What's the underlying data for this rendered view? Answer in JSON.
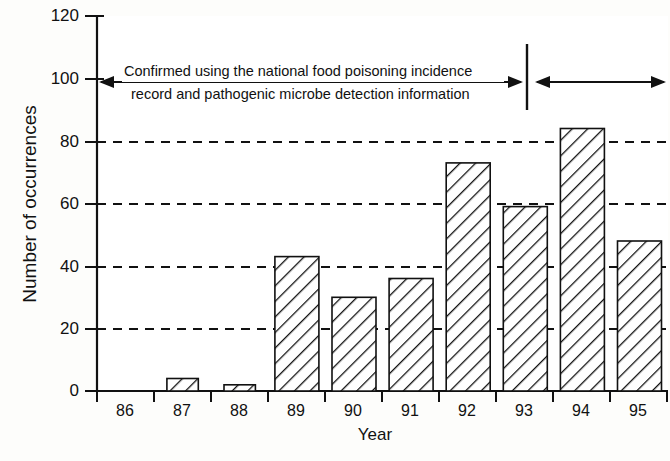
{
  "chart_data": {
    "type": "bar",
    "title": "",
    "xlabel": "Year",
    "ylabel": "Number of occurrences",
    "categories": [
      "86",
      "87",
      "88",
      "89",
      "90",
      "91",
      "92",
      "93",
      "94",
      "95"
    ],
    "values": [
      2,
      4,
      2,
      43,
      30,
      36,
      73,
      59,
      84,
      48
    ],
    "ylim": [
      0,
      120
    ],
    "yticks": [
      0,
      20,
      40,
      60,
      80,
      100,
      120
    ],
    "ytick_labels": [
      "0",
      "20",
      "40",
      "60",
      "80",
      "100",
      "120"
    ],
    "gridlines_at": [
      20,
      40,
      60,
      80
    ],
    "grid": "horizontal-dashed",
    "legend": "none",
    "bar_style": "diagonal-hatch-outline",
    "annotations": [
      {
        "name": "method-note",
        "line1": "Confirmed using the national food poisoning incidence",
        "line2": "record and pathogenic microbe detection information",
        "span_arrow": "double-headed-left-span",
        "span_start_category": "86",
        "span_end_category": "93"
      },
      {
        "name": "right-span-arrow",
        "text": "",
        "span_arrow": "double-headed-right-span",
        "span_start_category": "94",
        "span_end_category": "95"
      }
    ],
    "divider": {
      "name": "period-divider",
      "between_categories": [
        "93",
        "94"
      ],
      "orientation": "vertical"
    },
    "colors": {
      "ink": "#111111",
      "background": "#fdfdfb",
      "bar_fill": "#ffffff",
      "bar_stroke": "#111111"
    }
  }
}
